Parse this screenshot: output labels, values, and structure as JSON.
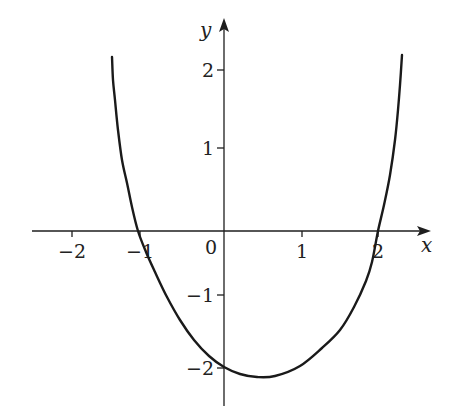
{
  "chart_data": {
    "type": "line",
    "title": "",
    "xlabel": "x",
    "ylabel": "y",
    "xlim": [
      -2.5,
      2.7
    ],
    "ylim": [
      -2.5,
      2.7
    ],
    "grid": false,
    "legend": null,
    "x_ticks": [
      {
        "value": -2,
        "label": "−2",
        "px": 72
      },
      {
        "value": -1,
        "label": "−1",
        "px": 140
      },
      {
        "value": 0,
        "label": "0",
        "px": 224
      },
      {
        "value": 1,
        "label": "1",
        "px": 302
      },
      {
        "value": 2,
        "label": "2",
        "px": 378
      }
    ],
    "y_ticks": [
      {
        "value": 2,
        "label": "2",
        "py": 70
      },
      {
        "value": 1,
        "label": "1",
        "py": 148
      },
      {
        "value": -1,
        "label": "−1",
        "py": 295
      },
      {
        "value": -2,
        "label": "−2",
        "py": 368
      }
    ],
    "series": [
      {
        "name": "curve",
        "x": [
          -1.45,
          -1.3,
          -1.2,
          -1.0,
          -0.8,
          -0.5,
          -0.25,
          0.0,
          0.2,
          0.45,
          0.7,
          1.0,
          1.3,
          1.5,
          1.8,
          2.0,
          2.15,
          2.25,
          2.33
        ],
        "y": [
          2.2,
          1.3,
          0.9,
          0.0,
          -0.6,
          -1.25,
          -1.7,
          -2.0,
          -2.08,
          -2.1,
          -2.02,
          -1.75,
          -1.35,
          -1.1,
          -0.55,
          0.0,
          0.6,
          1.3,
          2.2
        ]
      }
    ],
    "annotations": {
      "x_intercepts": [
        -1,
        2
      ],
      "y_intercept": -2,
      "minimum_approx": {
        "x": 0.45,
        "y": -2.1
      }
    }
  },
  "render": {
    "origin_px": [
      224,
      231
    ],
    "x_axis": {
      "x1": 32,
      "x2": 428,
      "y": 231
    },
    "y_axis": {
      "x": 224,
      "y1": 406,
      "y2": 21
    },
    "curve_px": [
      [
        112,
        57
      ],
      [
        113,
        80
      ],
      [
        115,
        100
      ],
      [
        118,
        130
      ],
      [
        122,
        160
      ],
      [
        127,
        183
      ],
      [
        132,
        207
      ],
      [
        138,
        231
      ],
      [
        146,
        252
      ],
      [
        155,
        272
      ],
      [
        167,
        297
      ],
      [
        180,
        320
      ],
      [
        194,
        340
      ],
      [
        209,
        356
      ],
      [
        224,
        367
      ],
      [
        240,
        374
      ],
      [
        257,
        377
      ],
      [
        275,
        376
      ],
      [
        300,
        366
      ],
      [
        322,
        348
      ],
      [
        340,
        330
      ],
      [
        354,
        307
      ],
      [
        366,
        281
      ],
      [
        372,
        262
      ],
      [
        378,
        231
      ],
      [
        384,
        205
      ],
      [
        390,
        175
      ],
      [
        395,
        140
      ],
      [
        398,
        110
      ],
      [
        400,
        85
      ],
      [
        402,
        55
      ]
    ],
    "colors": {
      "curve": "#1a1a1a",
      "axis": "#1e1e1e",
      "background": "#ffffff"
    }
  }
}
